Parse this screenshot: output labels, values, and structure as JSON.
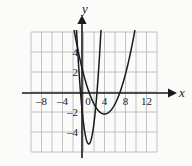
{
  "figure": {
    "background_color": "#fbfbfa",
    "grid_color": "#b9bcc0",
    "axis_color": "#1a1a1a",
    "curve_color": "#1a1a1a"
  },
  "axis_labels": {
    "x": "x",
    "y": "y"
  },
  "chart_data": {
    "type": "line",
    "title": "",
    "subtitle": "",
    "xlabel": "x",
    "ylabel": "y",
    "xlim": [
      -10,
      14
    ],
    "ylim": [
      -6,
      6
    ],
    "grid": true,
    "grid_step": 2,
    "legend": "none",
    "x_ticks": [
      -8,
      -4,
      0,
      4,
      8,
      12
    ],
    "x_tick_labels": [
      "–8",
      "–4",
      "0",
      "4",
      "8",
      "12"
    ],
    "y_ticks": [
      4,
      2,
      -2,
      -4
    ],
    "y_tick_labels": [
      "4",
      "2",
      "–2",
      "–4"
    ],
    "series": [
      {
        "name": "narrow-parabola",
        "type": "parabola",
        "vertex": [
          1,
          -5.2
        ],
        "leading_coefficient": 2.1,
        "x_intercepts": [
          -0.57,
          2.57
        ],
        "y_intercept": -3.1
      },
      {
        "name": "wide-parabola",
        "type": "parabola",
        "vertex": [
          4,
          -2.2
        ],
        "leading_coefficient": 0.25,
        "x_intercepts": [
          1.03,
          6.97
        ],
        "y_intercept": 1.8
      }
    ]
  }
}
